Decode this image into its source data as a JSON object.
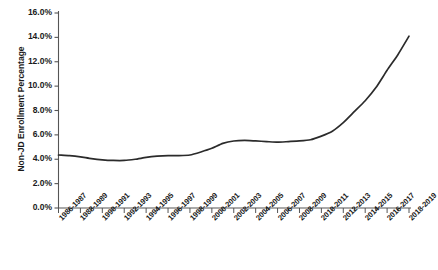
{
  "chart_data": {
    "type": "line",
    "title": "",
    "xlabel": "",
    "ylabel": "Non-JD Enrollment Percentage",
    "ylim": [
      0,
      16
    ],
    "ytick_labels": [
      "0.0%",
      "2.0%",
      "4.0%",
      "6.0%",
      "8.0%",
      "10.0%",
      "12.0%",
      "14.0%",
      "16.0%"
    ],
    "ytick_values": [
      0,
      2,
      4,
      6,
      8,
      10,
      12,
      14,
      16
    ],
    "grid": false,
    "legend": false,
    "line_color": "#2b2b2b",
    "axis_color": "#555555",
    "categories": [
      "1986-1987",
      "1987-1988",
      "1988-1989",
      "1989-1990",
      "1990-1991",
      "1991-1992",
      "1992-1993",
      "1993-1994",
      "1994-1995",
      "1995-1996",
      "1996-1997",
      "1997-1998",
      "1998-1999",
      "1999-2000",
      "2000-2001",
      "2001-2002",
      "2002-2003",
      "2003-2004",
      "2004-2005",
      "2005-2006",
      "2006-2007",
      "2007-2008",
      "2008-2009",
      "2009-2010",
      "2010-2011",
      "2011-2012",
      "2012-2013",
      "2013-2014",
      "2014-2015",
      "2015-2016",
      "2016-2017",
      "2017-2018",
      "2018-2019"
    ],
    "xtick_labels": [
      "1986-1987",
      "1988-1989",
      "1990-1991",
      "1992-1993",
      "1994-1995",
      "1996-1997",
      "1998-1999",
      "2000-2001",
      "2002-2003",
      "2004-2005",
      "2006-2007",
      "2008-2009",
      "2010-2011",
      "2012-2013",
      "2014-2015",
      "2016-2017",
      "2018-2019"
    ],
    "values": [
      4.35,
      4.3,
      4.2,
      4.05,
      3.95,
      3.9,
      3.9,
      4.0,
      4.15,
      4.25,
      4.3,
      4.3,
      4.35,
      4.6,
      4.9,
      5.3,
      5.5,
      5.55,
      5.5,
      5.45,
      5.4,
      5.45,
      5.5,
      5.6,
      5.9,
      6.3,
      7.0,
      7.9,
      8.8,
      9.9,
      11.3,
      12.6,
      14.1
    ]
  }
}
